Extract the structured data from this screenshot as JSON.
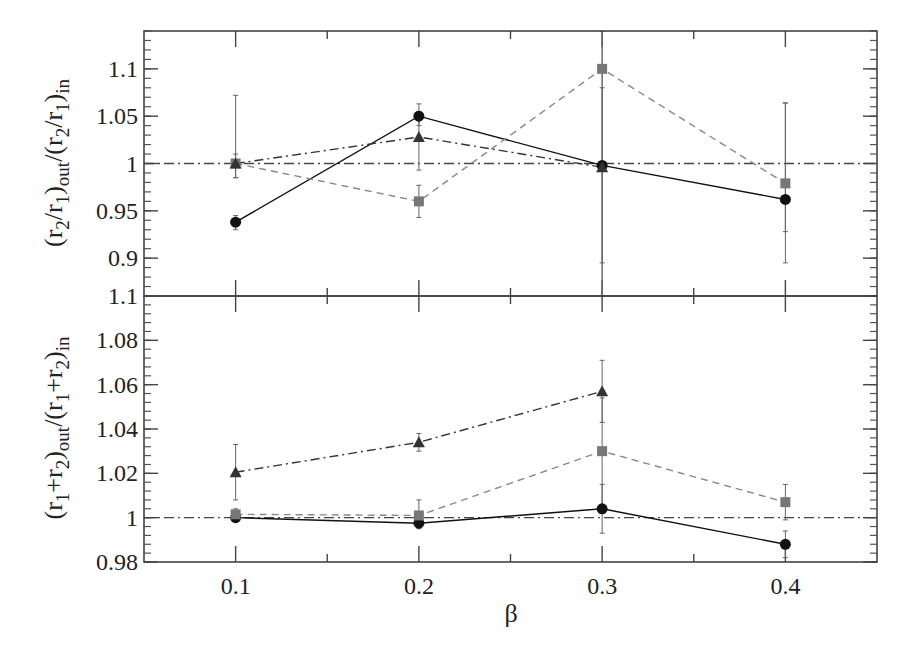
{
  "chart_data": [
    {
      "type": "line",
      "panel": "top",
      "title": "",
      "xlabel": "",
      "ylabel": "(r2/r1)out/(r2/r1)in",
      "ylabel_parts": {
        "open": "(r",
        "s1": "2",
        "mid1": "/r",
        "s2": "1",
        "close1": ")",
        "sub_out": "out",
        "slash": "/(r",
        "s3": "2",
        "mid2": "/r",
        "s4": "1",
        "close2": ")",
        "sub_in": "in"
      },
      "xlim": [
        0.05,
        0.45
      ],
      "ylim": [
        0.86,
        1.14
      ],
      "x": [
        0.1,
        0.2,
        0.3,
        0.4
      ],
      "yticks": [
        0.9,
        0.95,
        1.0,
        1.05,
        1.1
      ],
      "ytick_labels": [
        "0.9",
        "0.95",
        "1",
        "1.05",
        "1.1"
      ],
      "reference_line": 1.0,
      "grid": false,
      "series": [
        {
          "name": "circles",
          "marker": "circle",
          "line": "solid",
          "color": "#111111",
          "values": [
            0.938,
            1.05,
            0.998,
            0.962
          ],
          "err_low": [
            0.93,
            1.04,
            0.86,
            0.928
          ],
          "err_high": [
            0.945,
            1.063,
            1.14,
            1.064
          ]
        },
        {
          "name": "squares",
          "marker": "square",
          "line": "dashed",
          "color": "#777777",
          "values": [
            1.0,
            0.96,
            1.1,
            0.979
          ],
          "err_low": [
            0.985,
            0.943,
            0.86,
            0.895
          ],
          "err_high": [
            1.072,
            0.977,
            1.14,
            1.064
          ]
        },
        {
          "name": "triangles",
          "marker": "triangle",
          "line": "dashdot",
          "color": "#333333",
          "values": [
            1.0,
            1.028,
            0.996,
            null
          ],
          "err_low": [
            0.985,
            0.993,
            0.895,
            null
          ],
          "err_high": [
            1.01,
            1.055,
            1.08,
            null
          ]
        }
      ]
    },
    {
      "type": "line",
      "panel": "bottom",
      "title": "",
      "xlabel": "β",
      "ylabel": "(r1+r2)out/(r1+r2)in",
      "ylabel_parts": {
        "open": "(r",
        "s1": "1",
        "mid1": "+r",
        "s2": "2",
        "close1": ")",
        "sub_out": "out",
        "slash": "/(r",
        "s3": "1",
        "mid2": "+r",
        "s4": "2",
        "close2": ")",
        "sub_in": "in"
      },
      "xlim": [
        0.05,
        0.45
      ],
      "ylim": [
        0.98,
        1.1
      ],
      "x": [
        0.1,
        0.2,
        0.3,
        0.4
      ],
      "xticks": [
        0.1,
        0.2,
        0.3,
        0.4
      ],
      "xtick_labels": [
        "0.1",
        "0.2",
        "0.3",
        "0.4"
      ],
      "yticks": [
        0.98,
        1.0,
        1.02,
        1.04,
        1.06,
        1.08,
        1.1
      ],
      "ytick_labels": [
        "0.98",
        "1",
        "1.02",
        "1.04",
        "1.06",
        "1.08",
        "1.1"
      ],
      "reference_line": 1.0,
      "grid": false,
      "series": [
        {
          "name": "circles",
          "marker": "circle",
          "line": "solid",
          "color": "#111111",
          "values": [
            1.0,
            0.9975,
            1.004,
            0.988
          ],
          "err_low": [
            0.999,
            0.995,
            0.993,
            0.982
          ],
          "err_high": [
            1.001,
            1.0,
            1.015,
            0.994
          ]
        },
        {
          "name": "squares",
          "marker": "square",
          "line": "dashed",
          "color": "#777777",
          "values": [
            1.0015,
            1.001,
            1.03,
            1.007
          ],
          "err_low": [
            0.999,
            0.998,
            1.005,
            0.999
          ],
          "err_high": [
            1.004,
            1.008,
            1.054,
            1.015
          ]
        },
        {
          "name": "triangles",
          "marker": "triangle",
          "line": "dashdot",
          "color": "#333333",
          "values": [
            1.0205,
            1.034,
            1.057,
            null
          ],
          "err_low": [
            1.008,
            1.03,
            1.043,
            null
          ],
          "err_high": [
            1.033,
            1.038,
            1.071,
            null
          ]
        }
      ]
    }
  ],
  "layout": {
    "plot_left": 144,
    "plot_right": 877,
    "top_panel": {
      "y_top": 31,
      "y_bottom": 296
    },
    "bottom_panel": {
      "y_top": 296,
      "y_bottom": 562
    }
  }
}
